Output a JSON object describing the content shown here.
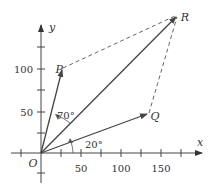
{
  "diagram": {
    "type": "vector-addition",
    "axes": {
      "x_label": "x",
      "y_label": "y",
      "origin_label": "O",
      "x_ticks": [
        "50",
        "100",
        "150"
      ],
      "y_ticks": [
        "50",
        "100"
      ]
    },
    "points": {
      "P": {
        "label": "P",
        "x": 25,
        "y": 100
      },
      "Q": {
        "label": "Q",
        "x": 140,
        "y": 48
      },
      "R": {
        "label": "R",
        "x": 170,
        "y": 168
      }
    },
    "angles": {
      "angle_POR": "70°",
      "angle_QOx": "20°"
    },
    "colors": {
      "line": "#555555",
      "text": "#333333",
      "background": "#ffffff"
    }
  }
}
